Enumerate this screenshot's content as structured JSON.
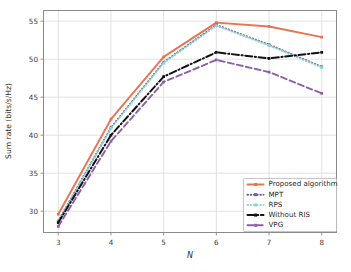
{
  "chart_data": {
    "type": "line",
    "title": "",
    "xlabel": "N",
    "ylabel": "Sum rate (bits/s/Hz)",
    "x": [
      3,
      4,
      5,
      6,
      7,
      8
    ],
    "xtick_labels": [
      "3",
      "4",
      "5",
      "6",
      "7",
      "8"
    ],
    "ytick_labels": [
      "30",
      "35",
      "40",
      "45",
      "50",
      "55"
    ],
    "yticks": [
      30,
      35,
      40,
      45,
      50,
      55
    ],
    "xlim": [
      2.72,
      8.28
    ],
    "ylim": [
      27.2,
      56.4
    ],
    "grid": true,
    "legend_position": "lower right",
    "series": [
      {
        "name": "Proposed algorithm",
        "label": "Proposed algorithm",
        "color": "#ED7250",
        "linestyle": "solid",
        "marker": "square",
        "values": [
          29.6,
          42.1,
          50.3,
          54.8,
          54.3,
          52.9
        ]
      },
      {
        "name": "MPT",
        "label": "MPT",
        "color": "#6B5B9A",
        "linestyle": "dotted",
        "marker": "square",
        "values": [
          28.7,
          41.0,
          49.6,
          54.5,
          51.9,
          49.0
        ]
      },
      {
        "name": "RPS",
        "label": "RPS",
        "color": "#8FD4CE",
        "linestyle": "dotted",
        "marker": "square",
        "values": [
          28.6,
          40.9,
          49.5,
          54.4,
          51.8,
          48.9
        ]
      },
      {
        "name": "Without RIS",
        "label": "Without RIS",
        "color": "#111111",
        "linestyle": "dashdot",
        "marker": "square",
        "values": [
          28.5,
          40.0,
          47.7,
          50.9,
          50.1,
          50.9
        ]
      },
      {
        "name": "VPG",
        "label": "VPG",
        "color": "#8C5FA8",
        "linestyle": "dashed",
        "marker": "square",
        "values": [
          28.0,
          39.2,
          47.0,
          49.9,
          48.3,
          45.5
        ]
      }
    ]
  },
  "figure": {
    "background_color": "#ffffff",
    "grid_color": "#d9d9d9",
    "axis_color": "#8a8a8a"
  }
}
